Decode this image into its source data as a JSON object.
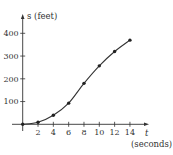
{
  "chart_data": {
    "type": "line",
    "title": "",
    "xlabel": "t (seconds)",
    "ylabel": "s (feet)",
    "x_axis_symbol": "t",
    "x_axis_units": "(seconds)",
    "y_axis_symbol": "s",
    "y_axis_units": "(feet)",
    "x_ticks": [
      2,
      4,
      6,
      8,
      10,
      12,
      14
    ],
    "y_ticks": [
      100,
      200,
      300,
      400
    ],
    "xlim": [
      0,
      15
    ],
    "ylim": [
      0,
      450
    ],
    "grid": false,
    "legend": null,
    "series": [
      {
        "name": "s(t)",
        "markers": true,
        "x": [
          0,
          2,
          4,
          6,
          8,
          10,
          12,
          14
        ],
        "values": [
          0,
          9,
          40,
          93,
          180,
          257,
          320,
          370
        ]
      }
    ]
  },
  "labels": {
    "y_axis": "s (feet)",
    "x_axis_symbol": "t",
    "x_axis_units": "(seconds)",
    "x_ticks": [
      "2",
      "4",
      "6",
      "8",
      "10",
      "12",
      "14"
    ],
    "y_ticks": [
      "100",
      "200",
      "300",
      "400"
    ]
  }
}
